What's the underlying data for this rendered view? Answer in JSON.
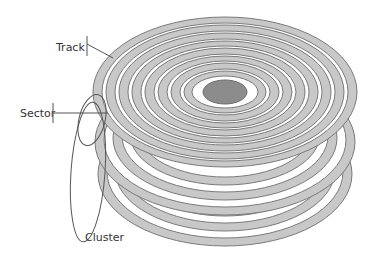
{
  "diagram": {
    "labels": {
      "track": "Track",
      "sector": "Sector",
      "cluster": "Cluster"
    },
    "colors": {
      "track_fill": "#c8c8c8",
      "track_stroke": "#7a7a7a",
      "gap": "#ffffff",
      "hub": "#8c8c8c",
      "outline": "#555555",
      "text": "#333333"
    },
    "platter_count": 3,
    "track_count": 9
  }
}
